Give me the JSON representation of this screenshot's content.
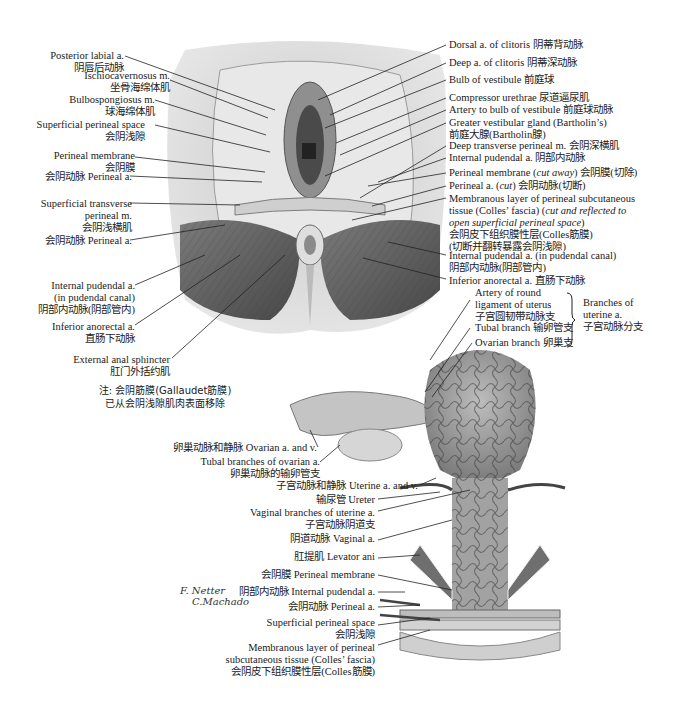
{
  "figure": {
    "top_panel": {
      "left_labels": [
        {
          "en": "Posterior labial a.",
          "zh": "阴唇后动脉"
        },
        {
          "en": "Ischiocavernosus m.",
          "zh": "坐骨海绵体肌"
        },
        {
          "en": "Bulbospongiosus m.",
          "zh": "球海绵体肌"
        },
        {
          "en": "Superficial perineal space",
          "zh": "会阴浅隙"
        },
        {
          "en": "Perineal membrane",
          "zh": "会阴膜"
        },
        {
          "en": "会阴动脉 Perineal a."
        },
        {
          "en": "Superficial transverse",
          "en2": "perineal m.",
          "zh": "会阴浅横肌"
        },
        {
          "en": "会阴动脉 Perineal a."
        },
        {
          "en": "Internal pudendal a.",
          "en2": "(in pudendal canal)",
          "zh": "阴部内动脉(阴部管内)"
        },
        {
          "en": "Inferior anorectal a.",
          "zh": "直肠下动脉"
        },
        {
          "en": "External anal sphincter",
          "zh": "肛门外括约肌"
        }
      ],
      "note": [
        "注: 会阴筋膜(Gallaudet筋膜)",
        "已从会阴浅隙肌肉表面移除"
      ],
      "right_labels": [
        {
          "text": "Dorsal a. of clitoris 阴蒂背动脉"
        },
        {
          "text": "Deep a. of clitoris 阴蒂深动脉"
        },
        {
          "text": "Bulb of vestibule 前庭球"
        },
        {
          "text": "Compressor urethrae 尿道逼尿肌"
        },
        {
          "text": "Artery to bulb of vestibule 前庭球动脉"
        },
        {
          "text": "Greater vestibular gland (Bartholin’s)",
          "line2": "前庭大腺(Bartholin腺)"
        },
        {
          "text": "Deep transverse perineal m. 会阴深横肌"
        },
        {
          "text": "Internal pudendal a. 阴部内动脉"
        },
        {
          "pre": "Perineal membrane (",
          "em": "cut away",
          "post": ") 会阴膜(切除)"
        },
        {
          "pre": "Perineal a. (",
          "em": "cut",
          "post": ") 会阴动脉(切断)"
        },
        {
          "line1": "Membranous layer of perineal subcutaneous",
          "line2pre": "tissue (Colles’ fascia) (",
          "line2em": "cut and reflected to",
          "line3em": "open superficial perineal space",
          "line3post": ")",
          "line4": "会阴皮下组织膜性层(Colles筋膜)",
          "line5": "(切断并翻转暴露会阴浅隙)"
        },
        {
          "text": "Internal pudendal a. (in pudendal canal)",
          "line2": "阴部内动脉(阴部管内)"
        },
        {
          "text": "Inferior anorectal a. 直肠下动脉"
        }
      ]
    },
    "bottom_panel": {
      "branch_labels": [
        {
          "l1": "Artery of round",
          "l2": "ligament of uterus",
          "l3": "子宫圆韧带动脉支"
        },
        {
          "text": "Tubal branch 输卵管支"
        },
        {
          "text": "Ovarian branch 卵巢支"
        }
      ],
      "brace_group": {
        "l1": "Branches of",
        "l2": "uterine a.",
        "l3": "子宫动脉分支"
      },
      "left_labels": [
        {
          "text": "卵巢动脉和静脉 Ovarian a. and v."
        },
        {
          "text": "Tubal branches of ovarian a.",
          "zh": "卵巢动脉的输卵管支"
        },
        {
          "text": "子宫动脉和静脉 Uterine a. and v."
        },
        {
          "text": "输尿管 Ureter"
        },
        {
          "text": "Vaginal branches of uterine a.",
          "zh": "子宫动脉阴道支"
        },
        {
          "text": "阴道动脉 Vaginal a."
        },
        {
          "text": "肛提肌 Levator ani"
        },
        {
          "text": "会阴膜 Perineal membrane"
        },
        {
          "text": "阴部内动脉 Internal pudendal a."
        },
        {
          "text": "会阴动脉 Perineal a."
        },
        {
          "text": "Superficial perineal space",
          "zh": "会阴浅隙"
        },
        {
          "l1": "Membranous layer of perineal",
          "l2": "subcutaneous tissue (Colles’ fascia)",
          "l3": "会阴皮下组织膜性层(Colles筋膜)"
        }
      ],
      "signature": {
        "l1": "F. Netter",
        "l2": "C.Machado"
      }
    },
    "colors": {
      "ink": "#1a1a1a",
      "tissue_light": "#d8d8d8",
      "tissue_mid": "#9a9a9a",
      "muscle_dark": "#5a5a5a",
      "vessel": "#3a3a3a"
    }
  }
}
